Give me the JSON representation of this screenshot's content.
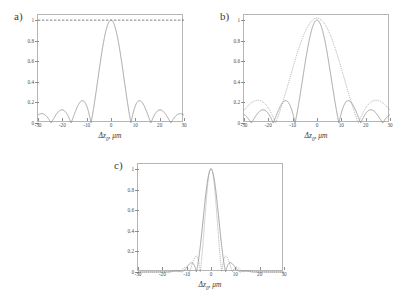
{
  "figure": {
    "background": "#ffffff",
    "curve_color": "#8d8d8d",
    "axis_color": "#8e8e8e",
    "text_color": "#3a3a3a"
  },
  "panels": [
    {
      "label": "a)",
      "xlabel_main": "Δz",
      "xlabel_sub": "0",
      "xlabel_rest": ", μm",
      "box": {
        "left": 37,
        "top": 14,
        "width": 146,
        "height": 108
      }
    },
    {
      "label": "b)",
      "xlabel_main": "Δz",
      "xlabel_sub": "0",
      "xlabel_rest": ", μm",
      "box": {
        "left": 243,
        "top": 14,
        "width": 146,
        "height": 108
      }
    },
    {
      "label": "c)",
      "xlabel_main": "Δz",
      "xlabel_sub": "0",
      "xlabel_rest": ", μm",
      "box": {
        "left": 137,
        "top": 163,
        "width": 146,
        "height": 108
      }
    }
  ],
  "chart_data": [
    {
      "type": "line",
      "title": "a)",
      "xlabel": "Δz0, μm",
      "ylabel": "",
      "xlim": [
        -30,
        30
      ],
      "ylim": [
        0,
        1.05
      ],
      "xticks": [
        -30,
        -20,
        -10,
        0,
        10,
        20,
        30
      ],
      "xticklabels": [
        "-30",
        "-20",
        "-10",
        "0",
        "10",
        "20",
        "30"
      ],
      "yticks": [
        0,
        0.2,
        0.4,
        0.6,
        0.8,
        1
      ],
      "yticklabels": [
        "0",
        "0.2",
        "0.4",
        "0.6",
        "0.8",
        "1"
      ],
      "grid": false,
      "legend": null,
      "annotations": [
        {
          "kind": "hline",
          "y": 1.0,
          "style": "dashed",
          "label": ""
        }
      ],
      "series": [
        {
          "name": "|sinc| autocorrelation, wide aperture",
          "style": "solid",
          "form": "abs_sinc",
          "main_lobe_zero_um": 8.2,
          "peak": 1.0,
          "sidelobe_peaks": [
            0.213,
            0.128,
            0.091,
            0.071
          ]
        }
      ]
    },
    {
      "type": "line",
      "title": "b)",
      "xlabel": "Δz0, μm",
      "ylabel": "",
      "xlim": [
        -30,
        30
      ],
      "ylim": [
        0,
        1.05
      ],
      "xticks": [
        -30,
        -20,
        -10,
        0,
        10,
        20,
        30
      ],
      "xticklabels": [
        "-30",
        "-20",
        "-10",
        "0",
        "10",
        "20",
        "30"
      ],
      "yticks": [
        0,
        0.2,
        0.4,
        0.6,
        0.8,
        1
      ],
      "yticklabels": [
        "0",
        "0.2",
        "0.4",
        "0.6",
        "0.8",
        "1"
      ],
      "grid": false,
      "legend": null,
      "annotations": [],
      "series": [
        {
          "name": "narrow solid curve",
          "style": "solid",
          "form": "abs_sinc",
          "main_lobe_zero_um": 9.0,
          "peak": 1.0,
          "sidelobe_peaks": [
            0.19,
            0.12,
            0.085
          ]
        },
        {
          "name": "broad dotted curve",
          "style": "dotted",
          "form": "abs_sinc",
          "main_lobe_zero_um": 17.0,
          "peak": 1.02,
          "sidelobe_peaks": [
            0.195,
            0.12
          ]
        }
      ]
    },
    {
      "type": "line",
      "title": "c)",
      "xlabel": "Δz0, μm",
      "ylabel": "",
      "xlim": [
        -30,
        30
      ],
      "ylim": [
        0,
        1.05
      ],
      "xticks": [
        -30,
        -20,
        -10,
        0,
        10,
        20,
        30
      ],
      "xticklabels": [
        "-30",
        "-20",
        "-10",
        "0",
        "10",
        "20",
        "30"
      ],
      "yticks": [
        0,
        0.2,
        0.4,
        0.6,
        0.8,
        1
      ],
      "yticklabels": [
        "0",
        "0.2",
        "0.4",
        "0.6",
        "0.8",
        "1"
      ],
      "grid": false,
      "legend": null,
      "annotations": [],
      "series": [
        {
          "name": "solid narrow peak",
          "style": "solid",
          "form": "gauss_sinc",
          "main_lobe_zero_um": 6.0,
          "peak": 1.0,
          "sidelobe_peaks": [
            0.07,
            0.05,
            0.04
          ]
        },
        {
          "name": "dotted narrowest peak",
          "style": "dotted",
          "form": "gauss_sinc",
          "main_lobe_zero_um": 4.4,
          "peak": 1.01,
          "sidelobe_peaks": [
            0.11,
            0.08,
            0.06
          ]
        }
      ]
    }
  ]
}
